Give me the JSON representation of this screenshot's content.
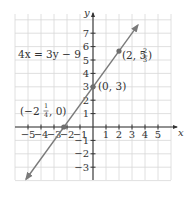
{
  "chart_data": {
    "type": "line",
    "title": "",
    "equation": "4x = 3y - 9",
    "xlabel": "x",
    "ylabel": "y",
    "xlim": [
      -5.8,
      5.9
    ],
    "ylim": [
      -3.9,
      8.5
    ],
    "grid": true,
    "x_ticks": [
      -5,
      -4,
      -3,
      -2,
      -1,
      1,
      2,
      3,
      4,
      5
    ],
    "x_tick_labels": [
      "−5",
      "−4",
      "−3",
      "−2",
      "−1",
      "1",
      "2",
      "3",
      "4",
      "5"
    ],
    "y_ticks": [
      -3,
      -2,
      -1,
      1,
      2,
      3,
      4,
      5,
      6,
      7
    ],
    "y_tick_labels": [
      "−3",
      "−2",
      "−1",
      "1",
      "2",
      "3",
      "4",
      "5",
      "6",
      "7"
    ],
    "series": [
      {
        "name": "4x = 3y - 9",
        "x": [
          -5.15,
          3.45
        ],
        "y": [
          -3.9,
          7.6
        ],
        "color": "#7a7a7a",
        "arrows": "both"
      }
    ],
    "points": [
      {
        "x": -2.25,
        "y": 0,
        "label": "(−2¼, 0)"
      },
      {
        "x": 0,
        "y": 3,
        "label": "(0, 3)"
      },
      {
        "x": 2,
        "y": 5.6667,
        "label": "(2, 5⅔)"
      }
    ]
  },
  "labels": {
    "equation": "4x = 3y − 9",
    "x_axis": "x",
    "y_axis": "y",
    "point_a": {
      "open": "(−2",
      "num": "1",
      "den": "4",
      "close": ", 0)"
    },
    "point_b": "(0, 3)",
    "point_c": {
      "open": "(2, 5",
      "num": "2",
      "den": "3",
      "close": ")"
    }
  },
  "colors": {
    "grid": "#d8d8d8",
    "axis": "#333333",
    "line": "#7a7a7a",
    "point": "#6e6e6e",
    "text": "#333333"
  }
}
